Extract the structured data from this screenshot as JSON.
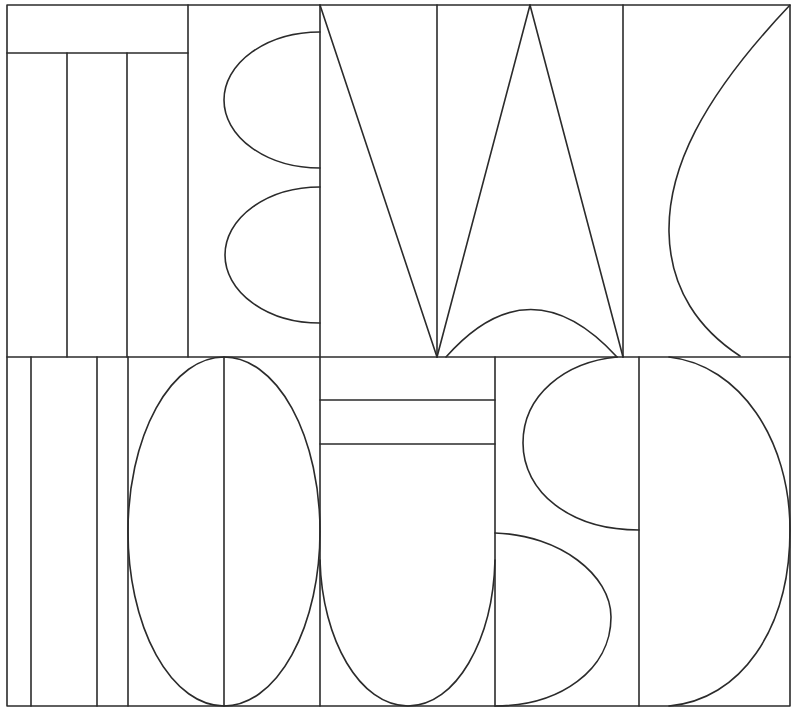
{
  "artwork": {
    "title": "Geometric line-art lettering panel",
    "stroke_color": "#2b2b2b",
    "background_color": "#ffffff",
    "stroke_width": 1.6
  },
  "panels": [
    {
      "name": "top-row-T-letter",
      "shapes": [
        "top-bar",
        "three-vertical-bars"
      ]
    },
    {
      "name": "top-row-B-half-ellipses",
      "shapes": [
        "upper-half-ellipse",
        "lower-half-ellipse"
      ]
    },
    {
      "name": "top-row-N-W-triangles",
      "shapes": [
        "diagonal-left",
        "tall-triangle",
        "bottom-arc"
      ]
    },
    {
      "name": "top-row-C-curve",
      "shapes": [
        "sweeping-curve"
      ]
    },
    {
      "name": "bottom-row-stripes",
      "shapes": [
        "vertical-stripes"
      ]
    },
    {
      "name": "bottom-row-O-ellipse",
      "shapes": [
        "full-ellipse",
        "center-line"
      ]
    },
    {
      "name": "bottom-row-U-shape",
      "shapes": [
        "two-bars",
        "u-curve"
      ]
    },
    {
      "name": "bottom-row-S-shape",
      "shapes": [
        "upper-bowl",
        "lower-bowl"
      ]
    },
    {
      "name": "bottom-row-D-shape",
      "shapes": [
        "half-oval"
      ]
    }
  ]
}
